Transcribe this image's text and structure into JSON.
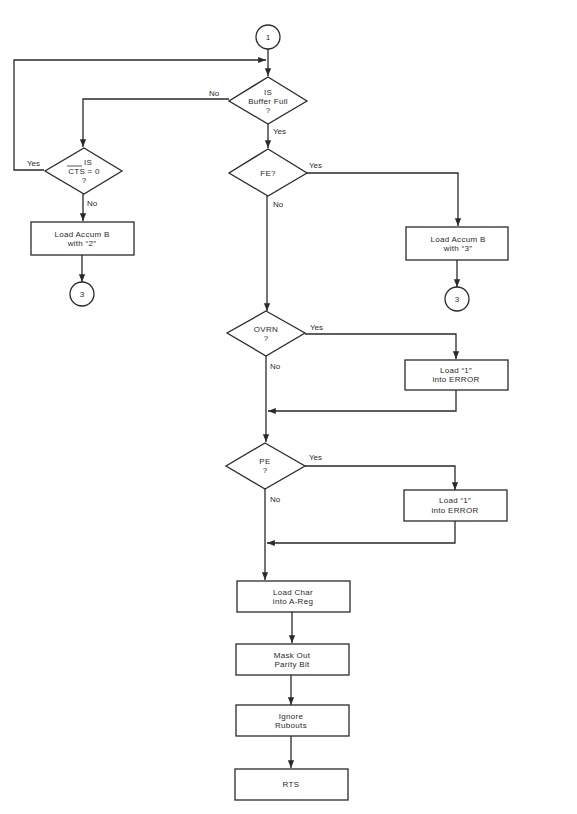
{
  "connectors": {
    "start": "1",
    "end_left": "3",
    "end_right": "3"
  },
  "decisions": {
    "buffer_full": {
      "line1": "IS",
      "line2": "Buffer Full",
      "line3": "?"
    },
    "cts": {
      "line1": "IS",
      "line2": "CTS = 0",
      "line3": "?"
    },
    "fe": {
      "line1": "FE?"
    },
    "ovrn": {
      "line1": "OVRN",
      "line2": "?"
    },
    "pe": {
      "line1": "PE",
      "line2": "?"
    }
  },
  "processes": {
    "load_b2": {
      "line1": "Load Accum B",
      "line2": "with “2”"
    },
    "load_b3": {
      "line1": "Load Accum B",
      "line2": "with “3”"
    },
    "err1": {
      "line1": "Load “1”",
      "line2": "into ERROR"
    },
    "err2": {
      "line1": "Load “1”",
      "line2": "into ERROR"
    },
    "load_char": {
      "line1": "Load Char",
      "line2": "into A-Reg"
    },
    "mask": {
      "line1": "Mask Out",
      "line2": "Parity Bit"
    },
    "ignore": {
      "line1": "Ignore",
      "line2": "Rubouts"
    },
    "rts": {
      "line1": "RTS"
    }
  },
  "edge_labels": {
    "buffer_no": "No",
    "buffer_yes": "Yes",
    "cts_yes": "Yes",
    "cts_no": "No",
    "fe_yes": "Yes",
    "fe_no": "No",
    "ovrn_yes": "Yes",
    "ovrn_no": "No",
    "pe_yes": "Yes",
    "pe_no": "No"
  }
}
